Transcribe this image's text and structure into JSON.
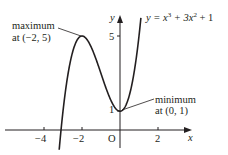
{
  "chart_data": {
    "type": "line",
    "title": "",
    "equation": "y = x³ + 3x² + 1",
    "xlabel": "x",
    "ylabel": "y",
    "origin_label": "O",
    "xlim": [
      -5,
      5
    ],
    "ylim": [
      -1,
      6
    ],
    "x_ticks": [
      -4,
      -2,
      2
    ],
    "x_tick_labels": [
      "−4",
      "−2",
      "2"
    ],
    "y_ticks": [
      1,
      5
    ],
    "y_tick_labels": [
      "1",
      "5"
    ],
    "series": [
      {
        "name": "y = x^3 + 3x^2 + 1",
        "function": "x^3 + 3x^2 + 1",
        "x": [
          -3.6,
          -3.4,
          -3.2,
          -3.0,
          -2.8,
          -2.6,
          -2.4,
          -2.2,
          -2.0,
          -1.8,
          -1.6,
          -1.4,
          -1.2,
          -1.0,
          -0.8,
          -0.6,
          -0.4,
          -0.2,
          0.0,
          0.2,
          0.4,
          0.6,
          0.8,
          1.0,
          1.2
        ],
        "y": [
          -1.78,
          -0.62,
          0.95,
          1.0,
          2.57,
          3.7,
          4.46,
          4.87,
          5.0,
          4.89,
          4.58,
          4.14,
          3.59,
          3.0,
          2.41,
          1.86,
          1.42,
          1.11,
          1.0,
          1.13,
          1.54,
          2.3,
          3.43,
          5.0,
          7.05
        ]
      }
    ],
    "annotations": [
      {
        "text_line1": "maximum",
        "text_line2": "at (−2, 5)",
        "point": [
          -2,
          5
        ]
      },
      {
        "text_line1": "minimum",
        "text_line2": "at (0, 1)",
        "point": [
          0,
          1
        ]
      }
    ],
    "grid": false,
    "legend": "none"
  },
  "labels": {
    "y_axis": "y",
    "x_axis": "x",
    "origin": "O",
    "tick_x_neg4": "−4",
    "tick_x_neg2": "−2",
    "tick_x_2": "2",
    "tick_y_1": "1",
    "tick_y_5": "5",
    "max_line1": "maximum",
    "max_line2": "at (−2, 5)",
    "min_line1": "minimum",
    "min_line2": "at (0, 1)",
    "eq_prefix": "y = x",
    "eq_exp1": "3",
    "eq_mid": " + 3x",
    "eq_exp2": "2",
    "eq_suffix": " + 1"
  }
}
